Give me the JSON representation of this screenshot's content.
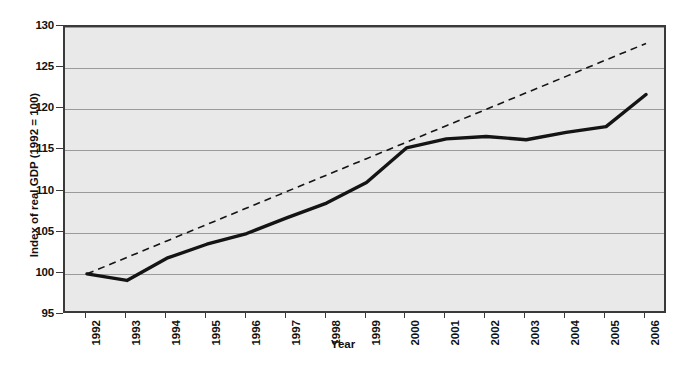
{
  "chart_data": {
    "type": "line",
    "title": "",
    "xlabel": "Year",
    "ylabel": "Index of real GDP (1992 = 100)",
    "x": [
      1992,
      1993,
      1994,
      1995,
      1996,
      1997,
      1998,
      1999,
      2000,
      2001,
      2002,
      2003,
      2004,
      2005,
      2006
    ],
    "categories": [
      "1992",
      "1993",
      "1994",
      "1995",
      "1996",
      "1997",
      "1998",
      "1999",
      "2000",
      "2001",
      "2002",
      "2003",
      "2004",
      "2005",
      "2006"
    ],
    "series": [
      {
        "name": "Index of real GDP",
        "style": "solid",
        "color": "#141414",
        "values": [
          100.0,
          99.2,
          101.9,
          103.6,
          104.9,
          106.8,
          108.6,
          111.1,
          115.3,
          116.4,
          116.7,
          116.3,
          117.2,
          117.9,
          121.8
        ]
      },
      {
        "name": "Trend",
        "style": "dashed",
        "color": "#141414",
        "values": [
          100.0,
          102.0,
          104.0,
          106.0,
          108.0,
          110.0,
          112.0,
          114.0,
          116.0,
          118.0,
          120.0,
          122.0,
          124.0,
          126.0,
          128.0
        ]
      }
    ],
    "ylim": [
      95,
      130
    ],
    "yticks": [
      95,
      100,
      105,
      110,
      115,
      120,
      125,
      130
    ],
    "ytick_labels": [
      "95",
      "100",
      "105",
      "110",
      "115",
      "120",
      "125",
      "130"
    ],
    "xlim": [
      1992,
      2006
    ],
    "grid": "horizontal",
    "legend": "none",
    "plot_background": "#e9e9e9",
    "gridline_color": "#9a9a9a",
    "frame_color": "#3a3a3a"
  }
}
